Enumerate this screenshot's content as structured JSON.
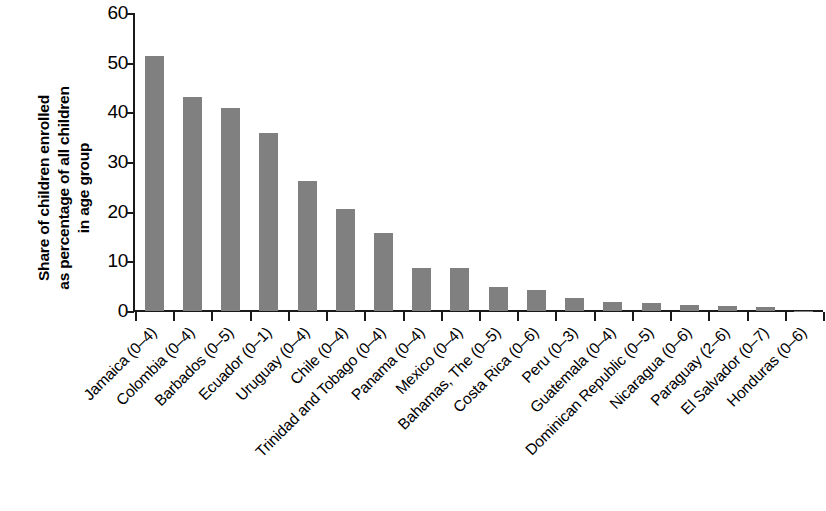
{
  "chart_data": {
    "type": "bar",
    "title": "",
    "subtitle": "",
    "xlabel": "",
    "ylabel": "Share of children enrolled as percentage of all children in age group",
    "ylabel_lines": [
      "Share of children enrolled",
      "as percentage of all children",
      "in age group"
    ],
    "categories": [
      "Jamaica (0–4)",
      "Colombia (0–4)",
      "Barbados (0–5)",
      "Ecuador (0–1)",
      "Uruguay (0–4)",
      "Chile (0–4)",
      "Trinidad and Tobago (0–4)",
      "Panama (0–4)",
      "Mexico (0–4)",
      "Bahamas, The (0–5)",
      "Costa Rica (0–6)",
      "Peru (0–3)",
      "Guatemala (0–4)",
      "Dominican Republic (0–5)",
      "Nicaragua (0–6)",
      "Paraguay (2–6)",
      "El Salvador (0–7)",
      "Honduras (0–6)"
    ],
    "values": [
      51.3,
      43.0,
      40.8,
      35.9,
      26.1,
      20.6,
      15.7,
      8.7,
      8.7,
      4.8,
      4.2,
      2.7,
      1.9,
      1.7,
      1.2,
      1.0,
      0.8,
      0.1
    ],
    "ylim": [
      0,
      60
    ],
    "ytick_labels": [
      "0",
      "10",
      "20",
      "30",
      "40",
      "50",
      "60"
    ],
    "yticks": [
      0,
      10,
      20,
      30,
      40,
      50,
      60
    ],
    "grid": false,
    "legend": false,
    "legend_position": "none",
    "bar_color": "#808080",
    "axis_color": "#1a1a1a",
    "background_color": "#ffffff"
  }
}
